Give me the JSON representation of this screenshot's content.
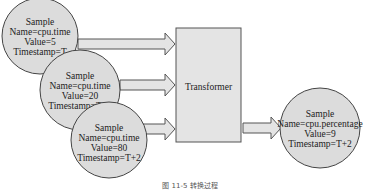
{
  "diagram": {
    "inputs": [
      {
        "title": "Sample",
        "name": "Name=cpu.time",
        "value": "Value=5",
        "timestamp": "Timestamp=T"
      },
      {
        "title": "Sample",
        "name": "Name=cpu.time",
        "value": "Value=20",
        "timestamp": "Timestamp=T+1"
      },
      {
        "title": "Sample",
        "name": "Name=cpu.time",
        "value": "Value=80",
        "timestamp": "Timestamp=T+2"
      }
    ],
    "transformer": {
      "label": "Transformer"
    },
    "output": {
      "title": "Sample",
      "name": "Name=cpu.percentage",
      "value": "Value=9",
      "timestamp": "Timestamp=T+2"
    },
    "caption": "图 11-5  转换过程"
  }
}
